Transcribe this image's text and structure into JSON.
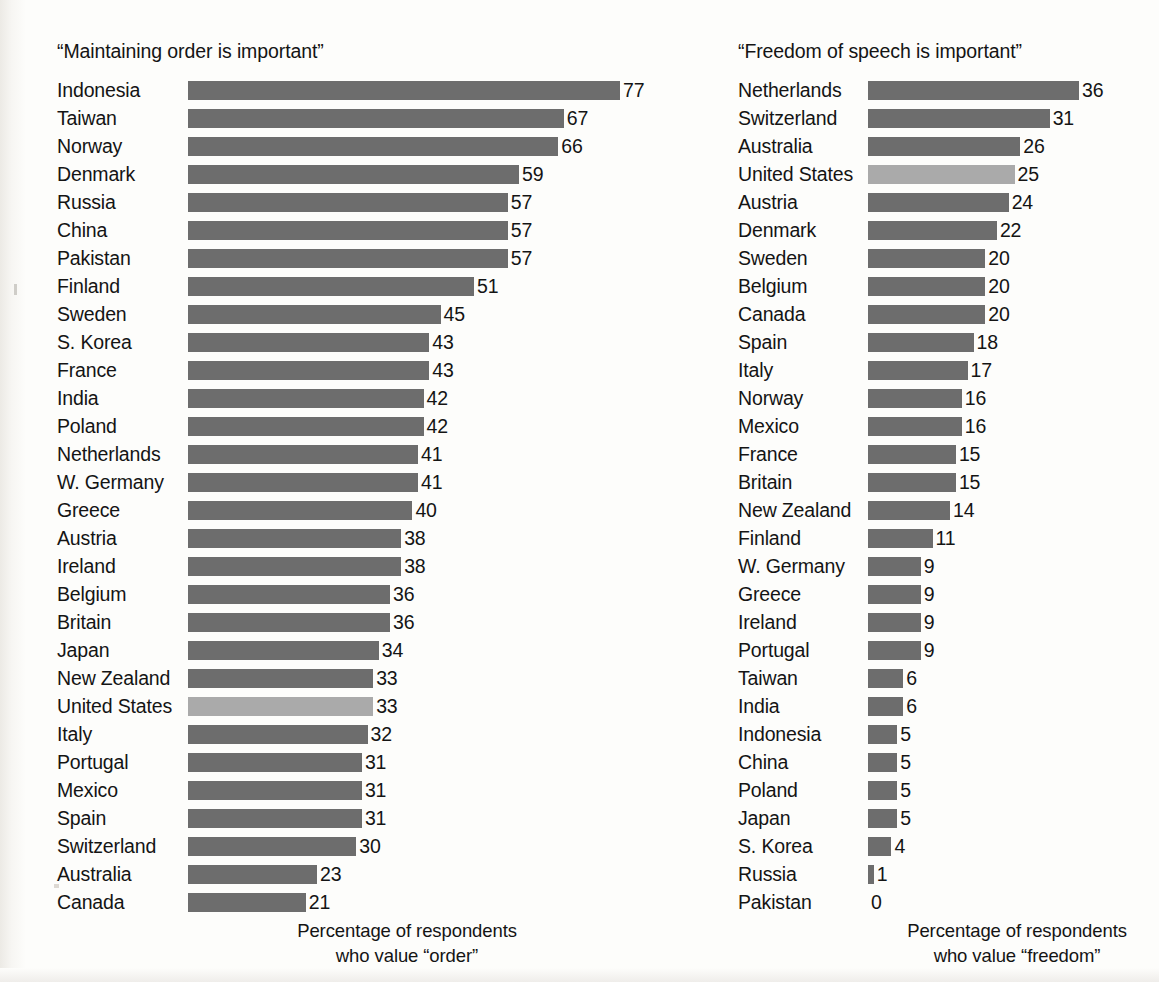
{
  "figure": {
    "background_color": "#fdfdfb",
    "bar_color": "#6d6d6d",
    "highlight_color": "#aaaaaa",
    "text_color": "#141414"
  },
  "panels": [
    {
      "key": "order",
      "title": "“Maintaining order is important”",
      "caption_line1": "Percentage of respondents",
      "caption_line2": "who value “order”"
    },
    {
      "key": "freedom",
      "title": "“Freedom of speech is important”",
      "caption_line1": "Percentage of respondents",
      "caption_line2": "who value “freedom”"
    }
  ],
  "chart_data": [
    {
      "type": "bar",
      "orientation": "horizontal",
      "title": "“Maintaining order is important”",
      "xlabel": "Percentage of respondents who value “order”",
      "ylabel": "",
      "xlim": [
        0,
        77
      ],
      "grid": false,
      "legend": "none",
      "value_labels": true,
      "highlight_category": "United States",
      "highlight_color": "#aaaaaa",
      "bar_color": "#6d6d6d",
      "px_per_unit": 5.61,
      "categories": [
        "Indonesia",
        "Taiwan",
        "Norway",
        "Denmark",
        "Russia",
        "China",
        "Pakistan",
        "Finland",
        "Sweden",
        "S. Korea",
        "France",
        "India",
        "Poland",
        "Netherlands",
        "W. Germany",
        "Greece",
        "Austria",
        "Ireland",
        "Belgium",
        "Britain",
        "Japan",
        "New Zealand",
        "United States",
        "Italy",
        "Portugal",
        "Mexico",
        "Spain",
        "Switzerland",
        "Australia",
        "Canada"
      ],
      "values": [
        77,
        67,
        66,
        59,
        57,
        57,
        57,
        51,
        45,
        43,
        43,
        42,
        42,
        41,
        41,
        40,
        38,
        38,
        36,
        36,
        34,
        33,
        33,
        32,
        31,
        31,
        31,
        30,
        23,
        21
      ]
    },
    {
      "type": "bar",
      "orientation": "horizontal",
      "title": "“Freedom of speech is important”",
      "xlabel": "Percentage of respondents who value “freedom”",
      "ylabel": "",
      "xlim": [
        0,
        36
      ],
      "grid": false,
      "legend": "none",
      "value_labels": true,
      "highlight_category": "United States",
      "highlight_color": "#aaaaaa",
      "bar_color": "#6d6d6d",
      "px_per_unit": 5.86,
      "categories": [
        "Netherlands",
        "Switzerland",
        "Australia",
        "United States",
        "Austria",
        "Denmark",
        "Sweden",
        "Belgium",
        "Canada",
        "Spain",
        "Italy",
        "Norway",
        "Mexico",
        "France",
        "Britain",
        "New Zealand",
        "Finland",
        "W. Germany",
        "Greece",
        "Ireland",
        "Portugal",
        "Taiwan",
        "India",
        "Indonesia",
        "China",
        "Poland",
        "Japan",
        "S. Korea",
        "Russia",
        "Pakistan"
      ],
      "values": [
        36,
        31,
        26,
        25,
        24,
        22,
        20,
        20,
        20,
        18,
        17,
        16,
        16,
        15,
        15,
        14,
        11,
        9,
        9,
        9,
        9,
        6,
        6,
        5,
        5,
        5,
        5,
        4,
        1,
        0
      ]
    }
  ]
}
